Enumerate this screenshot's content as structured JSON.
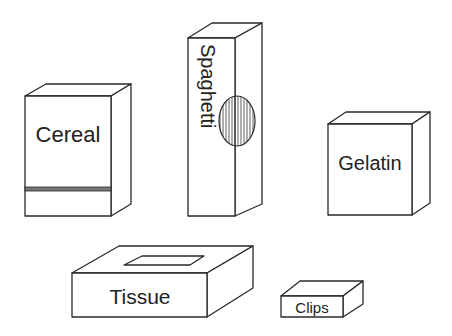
{
  "boxes": [
    {
      "name": "cereal",
      "label": "Cereal"
    },
    {
      "name": "spaghetti",
      "label": "Spaghetti"
    },
    {
      "name": "gelatin",
      "label": "Gelatin"
    },
    {
      "name": "tissue",
      "label": "Tissue"
    },
    {
      "name": "clips",
      "label": "Clips"
    }
  ],
  "colors": {
    "stroke": "#2a2a2a",
    "stripe": "#777777",
    "background": "#ffffff"
  }
}
